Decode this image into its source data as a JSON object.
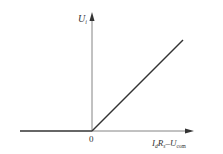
{
  "diagram": {
    "y_axis_label": "U",
    "y_axis_sub": "i",
    "origin_label": "0",
    "x_axis_label_parts": {
      "i": "I",
      "d": "d",
      "r": "R",
      "s": "s",
      "dash": "–",
      "u": "U",
      "com": "com"
    },
    "colors": {
      "line": "#333333",
      "axis": "#555555"
    }
  }
}
